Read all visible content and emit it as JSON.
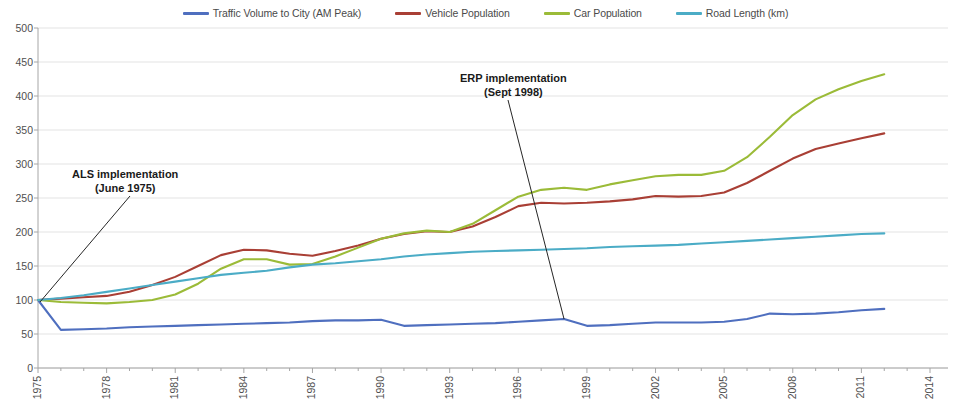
{
  "chart_data": {
    "type": "line",
    "title": "",
    "subtitle": "",
    "xlabel": "",
    "ylabel": "",
    "xlim": [
      1975,
      2014
    ],
    "ylim": [
      0,
      500
    ],
    "grid": true,
    "gridlines": "horizontal",
    "legend_position": "top-center",
    "index_base": "1975 = 100",
    "x": [
      1975,
      1976,
      1977,
      1978,
      1979,
      1980,
      1981,
      1982,
      1983,
      1984,
      1985,
      1986,
      1987,
      1988,
      1989,
      1990,
      1991,
      1992,
      1993,
      1994,
      1995,
      1996,
      1997,
      1998,
      1999,
      2000,
      2001,
      2002,
      2003,
      2004,
      2005,
      2006,
      2007,
      2008,
      2009,
      2010,
      2011,
      2012
    ],
    "xticks": [
      1975,
      1978,
      1981,
      1984,
      1987,
      1990,
      1993,
      1996,
      1999,
      2002,
      2005,
      2008,
      2011,
      2014
    ],
    "xtick_labels": [
      "1975",
      "1978",
      "1981",
      "1984",
      "1987",
      "1990",
      "1993",
      "1996",
      "1999",
      "2002",
      "2005",
      "2008",
      "2011",
      "2014"
    ],
    "yticks": [
      0,
      50,
      100,
      150,
      200,
      250,
      300,
      350,
      400,
      450,
      500
    ],
    "ytick_labels": [
      "0",
      "50",
      "100",
      "150",
      "200",
      "250",
      "300",
      "350",
      "400",
      "450",
      "500"
    ],
    "series": [
      {
        "name": "Traffic Volume to City (AM Peak)",
        "color": "#4f6fbf",
        "values": [
          100,
          56,
          57,
          58,
          60,
          61,
          62,
          63,
          64,
          65,
          66,
          67,
          69,
          70,
          70,
          71,
          62,
          63,
          64,
          65,
          66,
          68,
          70,
          72,
          62,
          63,
          65,
          67,
          67,
          67,
          68,
          72,
          80,
          79,
          80,
          82,
          85,
          87
        ]
      },
      {
        "name": "Vehicle Population",
        "color": "#a93f35",
        "values": [
          100,
          102,
          104,
          106,
          112,
          122,
          134,
          150,
          166,
          174,
          173,
          168,
          165,
          172,
          180,
          190,
          197,
          201,
          200,
          208,
          222,
          238,
          243,
          242,
          243,
          245,
          248,
          253,
          252,
          253,
          258,
          272,
          290,
          308,
          322,
          330,
          338,
          345
        ]
      },
      {
        "name": "Car Population",
        "color": "#9bbb38",
        "values": [
          100,
          97,
          96,
          95,
          97,
          100,
          108,
          124,
          146,
          160,
          160,
          152,
          153,
          164,
          177,
          190,
          198,
          202,
          200,
          212,
          232,
          252,
          262,
          265,
          262,
          270,
          276,
          282,
          284,
          284,
          290,
          310,
          340,
          372,
          395,
          410,
          422,
          432
        ]
      },
      {
        "name": "Road Length (km)",
        "color": "#4bacc6",
        "values": [
          100,
          103,
          107,
          112,
          117,
          122,
          127,
          132,
          137,
          140,
          143,
          148,
          152,
          154,
          157,
          160,
          164,
          167,
          169,
          171,
          172,
          173,
          174,
          175,
          176,
          178,
          179,
          180,
          181,
          183,
          185,
          187,
          189,
          191,
          193,
          195,
          197,
          198
        ]
      }
    ],
    "annotations": [
      {
        "id": "als",
        "line1": "ALS implementation",
        "line2": "(June 1975)",
        "target_x": 1975,
        "target_y": 100
      },
      {
        "id": "erp",
        "line1": "ERP implementation",
        "line2": "(Sept 1998)",
        "target_x": 1998,
        "target_y": 72
      }
    ]
  },
  "legend": {
    "items": [
      {
        "label": "Traffic Volume to City (AM Peak)",
        "color": "#4f6fbf"
      },
      {
        "label": "Vehicle Population",
        "color": "#a93f35"
      },
      {
        "label": "Car Population",
        "color": "#9bbb38"
      },
      {
        "label": "Road Length (km)",
        "color": "#4bacc6"
      }
    ]
  },
  "axes": {
    "y": {
      "min": 0,
      "max": 500,
      "step": 50
    },
    "x": {
      "min": 1975,
      "max": 2014,
      "step": 3
    }
  }
}
